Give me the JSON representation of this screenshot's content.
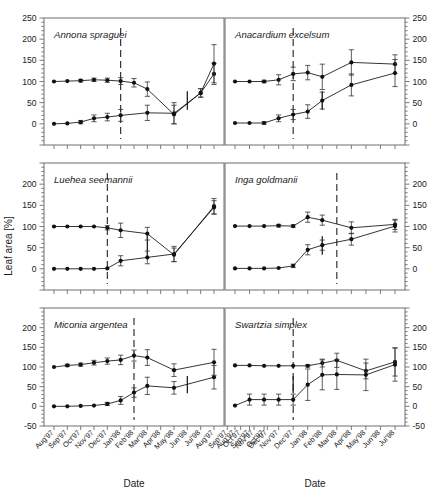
{
  "figure": {
    "width": 447,
    "height": 492,
    "axis_color": "#6e6e6e",
    "series_color": "#111111",
    "errorbar_color": "#333333",
    "refline_color": "#222222"
  },
  "axes": {
    "y_label": "Leaf area [%]",
    "x_label_left": "Date",
    "x_label_right": "Date",
    "y_ticks_top": [
      "250",
      "200",
      "150",
      "100",
      "50",
      "0"
    ],
    "y_ticks_middle": [
      "200",
      "150",
      "100",
      "50",
      "0"
    ],
    "y_ticks_bottom": [
      "200",
      "150",
      "100",
      "50",
      "0",
      "-50"
    ],
    "y_ticks_right_top": [
      "250",
      "200",
      "150",
      "100",
      "50",
      "0"
    ],
    "y_ticks_right_middle": [
      "200",
      "150",
      "100",
      "50",
      "0"
    ],
    "y_ticks_right_bottom": [
      "200",
      "150",
      "100",
      "50",
      "0",
      "-50"
    ],
    "ylim": [
      -50,
      250
    ],
    "y_major_step": 50,
    "y_minor_step": 10,
    "x_ticks_left": [
      "Aug'97",
      "Sep'97",
      "Oct'97",
      "Nov'97",
      "Dec'97",
      "Jan'98",
      "Feb'98",
      "Mar'98",
      "Apr'98",
      "May'98",
      "Jun'98",
      "Jul'98",
      "Aug'97",
      "Sep'97",
      "Oct'97",
      "Nov'97",
      "Dec'97"
    ],
    "x_ticks_right": [
      "Aug'97",
      "Sep'97",
      "Oct'97",
      "Nov'97",
      "Dec'97",
      "Jan'98",
      "Feb'98",
      "Mar'98",
      "Apr'98",
      "May'98",
      "Jun'98",
      "Jul'98"
    ],
    "x_ticks_visible_left": [
      "Aug'97",
      "Sep'97",
      "Oct'97",
      "Nov'97",
      "Dec'97",
      "Jan'98",
      "Feb'98",
      "Mar'98",
      "Apr'98",
      "May'98",
      "Jun'98",
      "Jul'98",
      "Aug'97",
      "Se"
    ],
    "grid": false,
    "legend": "none"
  },
  "chart_data": {
    "type": "line",
    "title": "",
    "subtitle": "",
    "xlabel": "Date",
    "ylabel": "Leaf area [%]",
    "ylim": [
      -50,
      250
    ],
    "legend_position": "none",
    "annotations": [
      {
        "kind": "vertical-dashed-line",
        "note": "leaf exchange / reference date marker present in each panel"
      },
      {
        "kind": "vertical-solid-bar",
        "note": "short solid vertical bar marker present in each panel"
      }
    ],
    "panels": [
      {
        "id": "annona-spraguei",
        "species": "Annona spraguei",
        "row": 1,
        "col": 1,
        "x": [
          "Aug'97",
          "Sep'97",
          "Oct'97",
          "Nov'97",
          "Dec'97",
          "Jan'98",
          "Feb'98",
          "Mar'98",
          "Apr'98",
          "May'98",
          "Jun'98",
          "Jul'98",
          "Aug'98"
        ],
        "ylim": [
          -50,
          250
        ],
        "refline_x": "Jan'98",
        "solid_bar_x": "Jun'98",
        "series": [
          {
            "name": "upper",
            "values": [
              100,
              101,
              102,
              104,
              103,
              101,
              97,
              82,
              null,
              22,
              null,
              73,
              118
            ],
            "err": [
              2,
              2,
              3,
              4,
              5,
              8,
              10,
              17,
              null,
              22,
              null,
              10,
              25
            ]
          },
          {
            "name": "lower",
            "values": [
              0,
              1,
              4,
              13,
              16,
              20,
              null,
              26,
              null,
              25,
              null,
              73,
              142
            ],
            "err": [
              1,
              2,
              4,
              8,
              9,
              14,
              null,
              18,
              null,
              25,
              null,
              10,
              45
            ]
          }
        ]
      },
      {
        "id": "anacardium-excelsum",
        "species": "Anacardium excelsum",
        "row": 1,
        "col": 2,
        "x": [
          "Aug'97",
          "Sep'97",
          "Oct'97",
          "Nov'97",
          "Dec'97",
          "Jan'98",
          "Feb'98",
          "Mar'98",
          "Apr'98",
          "May'98",
          "Jun'98",
          "Jul'98"
        ],
        "ylim": [
          -50,
          250
        ],
        "refline_x": "Dec'97",
        "solid_bar_x": "Feb'98",
        "series": [
          {
            "name": "upper",
            "values": [
              100,
              100,
              100,
              104,
              118,
              121,
              111,
              null,
              145,
              null,
              null,
              141
            ],
            "err": [
              2,
              2,
              3,
              12,
              16,
              17,
              30,
              null,
              30,
              null,
              null,
              22
            ]
          },
          {
            "name": "lower",
            "values": [
              2,
              2,
              2,
              13,
              22,
              29,
              55,
              null,
              92,
              null,
              null,
              120
            ],
            "err": [
              2,
              2,
              3,
              8,
              12,
              16,
              20,
              null,
              26,
              null,
              null,
              32
            ]
          }
        ]
      },
      {
        "id": "luehea-seemannii",
        "species": "Luehea seemannii",
        "row": 2,
        "col": 1,
        "x": [
          "Aug'97",
          "Sep'97",
          "Oct'97",
          "Nov'97",
          "Dec'97",
          "Jan'98",
          "Feb'98",
          "Mar'98",
          "Apr'98",
          "May'98",
          "Jun'98",
          "Jul'98",
          "Aug'98"
        ],
        "ylim": [
          -50,
          250
        ],
        "refline_x": "Dec'97",
        "solid_bar_x": "Mar'98",
        "series": [
          {
            "name": "upper",
            "values": [
              100,
              100,
              100,
              100,
              97,
              91,
              null,
              83,
              null,
              33,
              null,
              null,
              148
            ],
            "err": [
              1,
              1,
              1,
              2,
              5,
              17,
              null,
              15,
              null,
              16,
              null,
              null,
              18
            ]
          },
          {
            "name": "lower",
            "values": [
              0,
              0,
              0,
              0,
              1,
              19,
              null,
              27,
              null,
              35,
              null,
              null,
              145
            ],
            "err": [
              1,
              1,
              1,
              1,
              2,
              12,
              null,
              15,
              null,
              18,
              null,
              null,
              16
            ]
          }
        ]
      },
      {
        "id": "inga-goldmanii",
        "species": "Inga goldmanii",
        "row": 2,
        "col": 2,
        "x": [
          "Aug'97",
          "Sep'97",
          "Oct'97",
          "Nov'97",
          "Dec'97",
          "Jan'98",
          "Feb'98",
          "Mar'98",
          "Apr'98",
          "May'98",
          "Jun'98",
          "Jul'98"
        ],
        "ylim": [
          -50,
          250
        ],
        "refline_x": "Mar'98",
        "solid_bar_x": "Feb'98",
        "series": [
          {
            "name": "upper",
            "values": [
              101,
              101,
              101,
              102,
              101,
              122,
              115,
              null,
              97,
              null,
              null,
              105
            ],
            "err": [
              2,
              2,
              2,
              3,
              3,
              12,
              12,
              null,
              14,
              null,
              null,
              12
            ]
          },
          {
            "name": "lower",
            "values": [
              1,
              1,
              1,
              2,
              7,
              45,
              56,
              null,
              70,
              null,
              null,
              101
            ],
            "err": [
              1,
              1,
              1,
              2,
              4,
              12,
              12,
              null,
              14,
              null,
              null,
              14
            ]
          }
        ]
      },
      {
        "id": "miconia-argentea",
        "species": "Miconia argentea",
        "row": 3,
        "col": 1,
        "x": [
          "Aug'97",
          "Sep'97",
          "Oct'97",
          "Nov'97",
          "Dec'97",
          "Jan'98",
          "Feb'98",
          "Mar'98",
          "Apr'98",
          "May'98",
          "Jun'98",
          "Jul'98",
          "Aug'98"
        ],
        "ylim": [
          -50,
          250
        ],
        "refline_x": "Feb'98",
        "solid_bar_x": "Jun'98",
        "series": [
          {
            "name": "upper",
            "values": [
              100,
              104,
              106,
              111,
              115,
              118,
              129,
              124,
              null,
              92,
              null,
              null,
              112
            ],
            "err": [
              2,
              3,
              4,
              6,
              8,
              12,
              14,
              20,
              null,
              16,
              null,
              null,
              33
            ]
          },
          {
            "name": "lower",
            "values": [
              0,
              0,
              1,
              2,
              6,
              15,
              35,
              52,
              null,
              47,
              null,
              null,
              74
            ],
            "err": [
              1,
              1,
              1,
              2,
              4,
              10,
              12,
              22,
              null,
              16,
              null,
              null,
              30
            ]
          }
        ]
      },
      {
        "id": "swartzia-simplex",
        "species": "Swartzia simplex",
        "row": 3,
        "col": 2,
        "x": [
          "Aug'97",
          "Sep'97",
          "Oct'97",
          "Nov'97",
          "Dec'97",
          "Jan'98",
          "Feb'98",
          "Mar'98",
          "Apr'98",
          "May'98",
          "Jun'98",
          "Jul'98"
        ],
        "ylim": [
          -50,
          250
        ],
        "refline_x": "Dec'97",
        "solid_bar_x": "Dec'97",
        "series": [
          {
            "name": "upper",
            "values": [
              104,
              104,
              103,
              103,
              103,
              103,
              110,
              117,
              null,
              90,
              null,
              113
            ],
            "err": [
              2,
              2,
              2,
              2,
              2,
              3,
              10,
              18,
              null,
              20,
              null,
              36
            ]
          },
          {
            "name": "lower",
            "values": [
              2,
              17,
              17,
              17,
              17,
              55,
              80,
              81,
              null,
              80,
              null,
              106
            ],
            "err": [
              2,
              14,
              14,
              14,
              14,
              40,
              38,
              38,
              null,
              40,
              null,
              42
            ]
          }
        ]
      }
    ]
  }
}
